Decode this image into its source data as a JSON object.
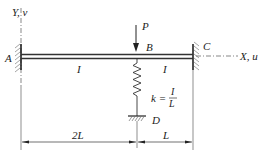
{
  "diagram": {
    "type": "structural-beam",
    "axes": {
      "y_label": "Y, v",
      "x_label": "X, u"
    },
    "nodes": {
      "A": "A",
      "B": "B",
      "C": "C",
      "D": "D"
    },
    "load": {
      "label": "P"
    },
    "segments": [
      {
        "from": "A",
        "to": "B",
        "inertia": "I"
      },
      {
        "from": "B",
        "to": "C",
        "inertia": "I"
      }
    ],
    "spring": {
      "label_lhs": "k =",
      "numerator": "I",
      "denominator": "L"
    },
    "dimensions": [
      {
        "label": "2L"
      },
      {
        "label": "L"
      }
    ],
    "colors": {
      "line": "#333333",
      "hatch": "#555555"
    }
  }
}
